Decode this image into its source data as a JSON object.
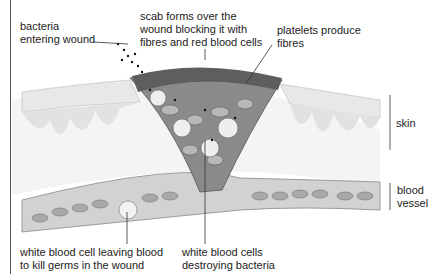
{
  "diagram": {
    "labels": {
      "bacteria": [
        "bacteria",
        "entering wound"
      ],
      "scab": [
        "scab forms over the",
        "wound blocking it with",
        "fibres and red blood cells"
      ],
      "platelets": [
        "platelets produce",
        "fibres"
      ],
      "skin": "skin",
      "blood_vessel": [
        "blood",
        "vessel"
      ],
      "wbc_leaving": [
        "white blood cell leaving blood",
        "to kill germs in the wound"
      ],
      "wbc_destroying": [
        "white blood cells",
        "destroying bacteria"
      ]
    },
    "colors": {
      "skin": "#e6e6e6",
      "scab": "#6a6a6a",
      "vessel": "#cfcfcf",
      "cells": "#9a9a9a",
      "line": "#333333"
    }
  }
}
